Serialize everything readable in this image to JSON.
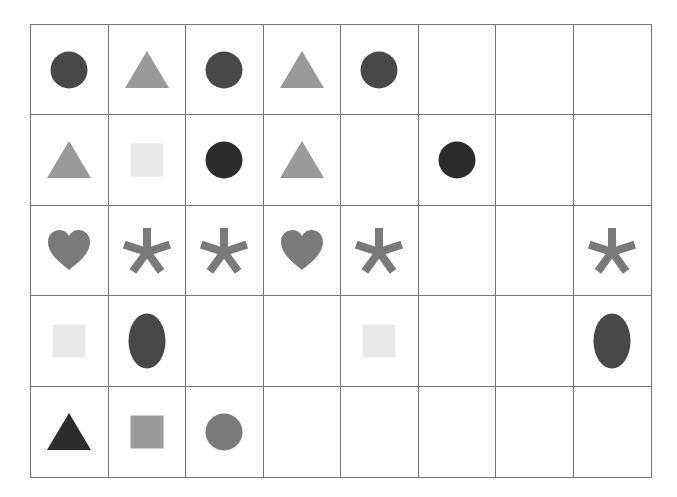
{
  "grid": {
    "rows": 5,
    "cols": 8,
    "colors": {
      "dark": "#484848",
      "darker": "#2c2c2c",
      "mid": "#7a7a7a",
      "light_gray": "#9a9a9a",
      "pale": "#e8e8e8",
      "line": "#777777"
    },
    "cells": [
      [
        {
          "shape": "circle",
          "color": "#484848"
        },
        {
          "shape": "triangle",
          "color": "#9a9a9a"
        },
        {
          "shape": "circle",
          "color": "#484848"
        },
        {
          "shape": "triangle",
          "color": "#9a9a9a"
        },
        {
          "shape": "circle",
          "color": "#484848"
        },
        null,
        null,
        null
      ],
      [
        {
          "shape": "triangle",
          "color": "#9a9a9a"
        },
        {
          "shape": "square",
          "color": "#e8e8e8"
        },
        {
          "shape": "circle",
          "color": "#2c2c2c"
        },
        {
          "shape": "triangle",
          "color": "#9a9a9a"
        },
        null,
        {
          "shape": "circle",
          "color": "#2c2c2c"
        },
        null,
        null
      ],
      [
        {
          "shape": "heart",
          "color": "#7a7a7a"
        },
        {
          "shape": "asterisk",
          "color": "#7a7a7a"
        },
        {
          "shape": "asterisk",
          "color": "#7a7a7a"
        },
        {
          "shape": "heart",
          "color": "#7a7a7a"
        },
        {
          "shape": "asterisk",
          "color": "#7a7a7a"
        },
        null,
        null,
        {
          "shape": "asterisk",
          "color": "#7a7a7a"
        }
      ],
      [
        {
          "shape": "square",
          "color": "#e8e8e8"
        },
        {
          "shape": "ellipse",
          "color": "#484848"
        },
        null,
        null,
        {
          "shape": "square",
          "color": "#e8e8e8"
        },
        null,
        null,
        {
          "shape": "ellipse",
          "color": "#484848"
        }
      ],
      [
        {
          "shape": "triangle",
          "color": "#2c2c2c"
        },
        {
          "shape": "square",
          "color": "#9a9a9a"
        },
        {
          "shape": "circle",
          "color": "#7a7a7a"
        },
        null,
        null,
        null,
        null,
        null
      ]
    ]
  }
}
